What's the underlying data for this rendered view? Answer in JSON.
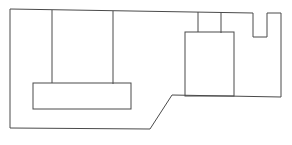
{
  "diagram": {
    "type": "floor-plan-outline",
    "stroke_color": "#4a4a4a",
    "background": "#ffffff",
    "outer_boundary": [
      [
        10,
        9
      ],
      [
        253,
        13
      ],
      [
        253,
        37
      ],
      [
        267,
        37
      ],
      [
        267,
        13
      ],
      [
        281,
        13
      ],
      [
        281,
        97
      ],
      [
        172,
        95
      ],
      [
        150,
        129
      ],
      [
        10,
        128
      ]
    ],
    "left_vertical_lines": [
      {
        "x1": 52,
        "y1": 10,
        "x2": 52,
        "y2": 83
      },
      {
        "x1": 113,
        "y1": 11,
        "x2": 113,
        "y2": 84
      }
    ],
    "lower_left_rect": {
      "x": 33,
      "y": 83,
      "width": 98,
      "height": 26
    },
    "right_rect": {
      "x": 185,
      "y": 32,
      "width": 49,
      "height": 64
    },
    "right_top_lines": [
      {
        "x1": 198,
        "y1": 12,
        "x2": 198,
        "y2": 32
      },
      {
        "x1": 221,
        "y1": 12,
        "x2": 221,
        "y2": 33
      }
    ]
  },
  "caption": ""
}
